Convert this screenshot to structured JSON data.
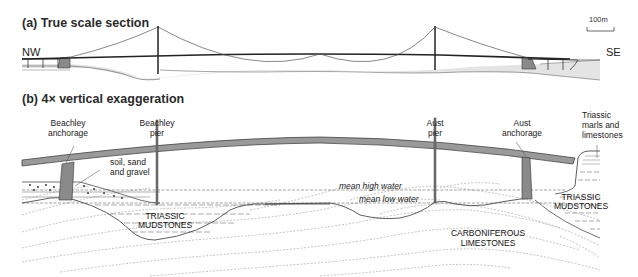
{
  "panel_a": {
    "title": "(a) True scale section",
    "direction_left": "NW",
    "direction_right": "SE",
    "scale_bar_label": "100m"
  },
  "panel_b": {
    "title": "(b) 4× vertical exaggeration",
    "labels": {
      "beachley_anchorage": [
        "Beachley",
        "anchorage"
      ],
      "beachley_pier": [
        "Beachley",
        "pier"
      ],
      "aust_pier": [
        "Aust",
        "pier"
      ],
      "aust_anchorage": [
        "Aust",
        "anchorage"
      ],
      "triassic_marls": [
        "Triassic",
        "marls and",
        "limestones"
      ],
      "soil": [
        "soil, sand",
        "and gravel"
      ],
      "mean_high_water": "mean high water",
      "mean_low_water": "mean low water",
      "triassic_mudstones_left": [
        "TRIASSIC",
        "MUDSTONES"
      ],
      "triassic_mudstones_right": [
        "TRIASSIC",
        "MUDSTONES"
      ],
      "carboniferous": [
        "CARBONIFEROUS",
        "LIMESTONES"
      ]
    }
  },
  "colors": {
    "deck_fill": "#9a9a9a",
    "anchorage_fill": "#8a8a8a",
    "sediment_fill": "#e4e4e4",
    "line": "#222222"
  }
}
